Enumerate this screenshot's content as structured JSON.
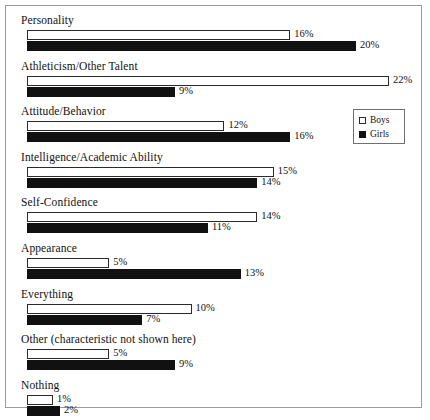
{
  "chart_data": {
    "type": "bar",
    "orientation": "horizontal",
    "title": "",
    "subtitle": "",
    "xlabel": "",
    "ylabel": "",
    "grid": false,
    "xlim": [
      0,
      22
    ],
    "value_suffix": "%",
    "legend_position": "right-upper",
    "categories": [
      "Personality",
      "Athleticism/Other Talent",
      "Attitude/Behavior",
      "Intelligence/Academic Ability",
      "Self-Confidence",
      "Appearance",
      "Everything",
      "Other (characteristic not shown here)",
      "Nothing"
    ],
    "series": [
      {
        "name": "Boys",
        "color": "#ffffff",
        "values": [
          16,
          22,
          12,
          15,
          14,
          5,
          10,
          5,
          1
        ],
        "labels": [
          "16%",
          "22%",
          "12%",
          "15%",
          "14%",
          "5%",
          "10%",
          "5%",
          "1%"
        ]
      },
      {
        "name": "Girls",
        "color": "#111111",
        "values": [
          20,
          9,
          16,
          14,
          11,
          13,
          7,
          9,
          2
        ],
        "labels": [
          "20%",
          "9%",
          "16%",
          "14%",
          "11%",
          "13%",
          "7%",
          "9%",
          "2%"
        ]
      }
    ]
  },
  "legend": {
    "items": [
      {
        "label": "Boys",
        "swatch": "boys-swatch-icon"
      },
      {
        "label": "Girls",
        "swatch": "girls-swatch-icon"
      }
    ]
  }
}
